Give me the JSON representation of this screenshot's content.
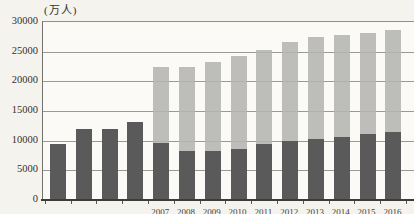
{
  "figure": {
    "unit_label": "(万人)",
    "colors": {
      "dark_bar": "#595a59",
      "light_bar": "#b4b5b2",
      "gridline": "#9a9a94",
      "baseline": "#3c3c38",
      "background": "#f5f3ee",
      "plot_background": "#fbfaf7",
      "tick_text": "#33312e"
    }
  },
  "chart_data": {
    "type": "bar",
    "stacked": true,
    "title": "",
    "unit": "(万人)",
    "categories": [
      "",
      "",
      "",
      "",
      "2007",
      "2008",
      "2009",
      "2010",
      "2011",
      "2012",
      "2013",
      "2014",
      "2015",
      "2016"
    ],
    "series": [
      {
        "name": "series-1-dark-lower-segment",
        "color": "#595a59",
        "values": [
          9400,
          11900,
          12000,
          13100,
          9600,
          8200,
          8300,
          8600,
          9400,
          9900,
          10300,
          10600,
          11100,
          11500
        ]
      },
      {
        "name": "series-2-light-upper-segment",
        "color": "#b4b5b2",
        "values": [
          0,
          0,
          0,
          0,
          12900,
          14300,
          15000,
          15700,
          15900,
          16800,
          17100,
          17300,
          17100,
          17200
        ]
      }
    ],
    "stacked_totals": [
      9400,
      11900,
      12000,
      13100,
      22500,
      22500,
      23300,
      24300,
      25300,
      26700,
      27400,
      27900,
      28200,
      28700
    ],
    "y_ticks": [
      0,
      5000,
      10000,
      15000,
      20000,
      25000,
      30000
    ],
    "ylim": [
      0,
      30000
    ],
    "xlabel": "",
    "ylabel": "(万人)",
    "grid": true,
    "legend": "none",
    "layout_notes": "x-axis year labels are clipped at the bottom edge of the screenshot; right side of plot runs to image edge"
  }
}
